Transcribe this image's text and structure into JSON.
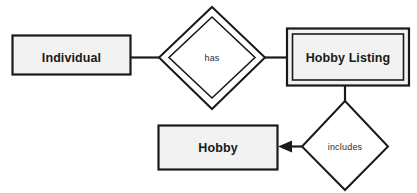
{
  "diagram": {
    "background_color": "#ffffff",
    "line_color": "#1a1a1a",
    "entity_fill_color": "#f2f2f2",
    "relationship_fill_color": "#ffffff",
    "entities": [
      {
        "id": "individual",
        "label": "Individual",
        "kind": "strong-entity",
        "shape": "rectangle",
        "double_border": false
      },
      {
        "id": "hobby-listing",
        "label": "Hobby Listing",
        "kind": "weak-entity",
        "shape": "double-rectangle",
        "double_border": true
      },
      {
        "id": "hobby",
        "label": "Hobby",
        "kind": "strong-entity",
        "shape": "rectangle",
        "double_border": false
      }
    ],
    "relationships": [
      {
        "id": "has",
        "label": "has",
        "kind": "identifying-relationship",
        "shape": "double-diamond",
        "double_border": true,
        "from": "individual",
        "to": "hobby-listing"
      },
      {
        "id": "includes",
        "label": "includes",
        "kind": "relationship",
        "shape": "diamond",
        "double_border": false,
        "from": "hobby-listing",
        "to": "hobby",
        "arrow": "to-hobby"
      }
    ],
    "connectors": [
      {
        "id": "individual-to-has",
        "from": "individual",
        "to": "has",
        "arrow": false
      },
      {
        "id": "has-to-hobby-listing",
        "from": "has",
        "to": "hobby-listing",
        "arrow": false
      },
      {
        "id": "hobby-listing-to-includes",
        "from": "hobby-listing",
        "to": "includes",
        "arrow": false
      },
      {
        "id": "includes-to-hobby",
        "from": "includes",
        "to": "hobby",
        "arrow": true
      }
    ]
  }
}
